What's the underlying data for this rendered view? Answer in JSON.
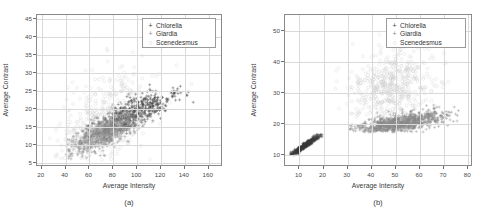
{
  "figure": {
    "panels": [
      {
        "caption": "(a)",
        "axes": {
          "xlabel": "Average Intensity",
          "ylabel": "Average Contrast",
          "xticks": [
            20,
            40,
            60,
            80,
            100,
            120,
            140,
            160
          ],
          "yticks": [
            5,
            10,
            15,
            20,
            25,
            30,
            35,
            40,
            45
          ],
          "xlim": [
            16,
            172
          ],
          "ylim": [
            4,
            46
          ],
          "grid": true
        },
        "legend": {
          "position": "top-right",
          "entries": [
            {
              "label": "Chlorella",
              "marker": "+",
              "color": "#3a3a3a"
            },
            {
              "label": "Giardia",
              "marker": "+",
              "color": "#8c8c8c"
            },
            {
              "label": "Scenedesmus",
              "marker": "o",
              "color": "#c9c9c9"
            }
          ]
        }
      },
      {
        "caption": "(b)",
        "axes": {
          "xlabel": "Average Intensity",
          "ylabel": "Average Contrast",
          "xticks": [
            10,
            20,
            30,
            40,
            50,
            60,
            70,
            80
          ],
          "yticks": [
            10,
            20,
            30,
            40,
            50
          ],
          "xlim": [
            4,
            82
          ],
          "ylim": [
            6,
            55
          ],
          "grid": true
        },
        "legend": {
          "position": "top-right",
          "entries": [
            {
              "label": "Chlorella",
              "marker": "+",
              "color": "#3a3a3a"
            },
            {
              "label": "Giardia",
              "marker": "+",
              "color": "#8c8c8c"
            },
            {
              "label": "Scenedesmus",
              "marker": "o",
              "color": "#c9c9c9"
            }
          ]
        }
      }
    ]
  },
  "chart_data": [
    {
      "type": "scatter",
      "title": "(a)",
      "xlabel": "Average Intensity",
      "ylabel": "Average Contrast",
      "xlim": [
        16,
        172
      ],
      "ylim": [
        4,
        46
      ],
      "xticks": [
        20,
        40,
        60,
        80,
        100,
        120,
        140,
        160
      ],
      "yticks": [
        5,
        10,
        15,
        20,
        25,
        30,
        35,
        40,
        45
      ],
      "grid": true,
      "legend_position": "top-right",
      "series": [
        {
          "name": "Chlorella",
          "marker": "+",
          "color": "#3a3a3a",
          "n_points": 520,
          "cluster": {
            "x_mean": 95,
            "x_std": 18,
            "x_range": [
              55,
              160
            ],
            "y_mean": 18.5,
            "y_std": 3.2,
            "y_range": [
              9,
              30
            ],
            "correlation": 0.78,
            "description": "Dark plus markers forming an elongated positively-correlated band from (55,11) to (160,26), densest near (95,18)."
          }
        },
        {
          "name": "Giardia",
          "marker": "+",
          "color": "#8c8c8c",
          "n_points": 900,
          "cluster": {
            "x_mean": 72,
            "x_std": 14,
            "x_range": [
              40,
              110
            ],
            "y_mean": 13.5,
            "y_std": 2.8,
            "y_range": [
              6,
              22
            ],
            "correlation": 0.72,
            "description": "Mid-gray plus markers, very dense lower-left lobe from (40,7) to (110,22), densest near (72,13)."
          }
        },
        {
          "name": "Scenedesmus",
          "marker": "o",
          "color": "#c9c9c9",
          "n_points": 430,
          "cluster": {
            "x_mean": 70,
            "x_std": 22,
            "x_range": [
              25,
              160
            ],
            "y_mean": 17,
            "y_std": 7.0,
            "y_range": [
              6,
              45
            ],
            "correlation": 0.45,
            "description": "Pale open circles, broadly scattered with sparse high-contrast outliers up to 45 and a dense core overlapping the Giardia lobe."
          }
        }
      ]
    },
    {
      "type": "scatter",
      "title": "(b)",
      "xlabel": "Average Intensity",
      "ylabel": "Average Contrast",
      "xlim": [
        4,
        82
      ],
      "ylim": [
        6,
        55
      ],
      "xticks": [
        10,
        20,
        30,
        40,
        50,
        60,
        70,
        80
      ],
      "yticks": [
        10,
        20,
        30,
        40,
        50
      ],
      "grid": true,
      "legend_position": "top-right",
      "series": [
        {
          "name": "Chlorella",
          "marker": "+",
          "color": "#3a3a3a",
          "n_points": 340,
          "cluster": {
            "x_mean": 12,
            "x_std": 3.6,
            "x_range": [
              6,
              20
            ],
            "y_mean": 12.8,
            "y_std": 2.0,
            "y_range": [
              9,
              17
            ],
            "correlation": 0.97,
            "description": "Dark tight near-linear diagonal band from (6,9.2) to (20,17) in the lower-left corner."
          }
        },
        {
          "name": "Giardia",
          "marker": "+",
          "color": "#8c8c8c",
          "n_points": 950,
          "cluster": {
            "x_mean": 52,
            "x_std": 9,
            "x_range": [
              29,
              76
            ],
            "y_mean": 20.2,
            "y_std": 1.8,
            "y_range": [
              17,
              26
            ],
            "correlation": 0.62,
            "description": "Dense gray horizontal band near contrast 19-20 from x=39 to x=62, rising to 25 by x=76; a few stray points near x=30."
          }
        },
        {
          "name": "Scenedesmus",
          "marker": "o",
          "color": "#c9c9c9",
          "n_points": 520,
          "cluster": {
            "x_mean": 48,
            "x_std": 9,
            "x_range": [
              24,
              72
            ],
            "y_mean": 32,
            "y_std": 5.5,
            "y_range": [
              20,
              50
            ],
            "correlation": 0.1,
            "description": "Pale open-circle cloud centered near (48,32) spanning contrast 20-50, plus a small satellite group near (25,40)."
          }
        }
      ]
    }
  ]
}
